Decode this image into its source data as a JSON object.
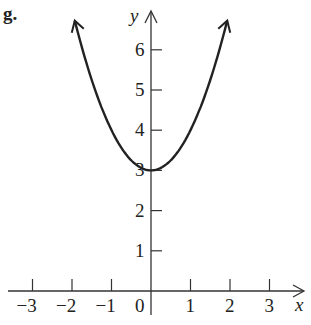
{
  "panel_label": "g.",
  "chart_data": {
    "type": "line",
    "title": "g.",
    "xlabel": "x",
    "ylabel": "y",
    "function": "y = x^2 + 3",
    "xlim": [
      -3.2,
      3.6
    ],
    "ylim": [
      -0.6,
      6.9
    ],
    "x_ticks": [
      -3,
      -2,
      -1,
      0,
      1,
      2,
      3
    ],
    "x_tick_labels": [
      "−3",
      "−2",
      "−1",
      "0",
      "1",
      "2",
      "3"
    ],
    "y_ticks": [
      1,
      2,
      3,
      4,
      5,
      6
    ],
    "y_tick_labels": [
      "1",
      "2",
      "3",
      "4",
      "5",
      "6"
    ],
    "series": [
      {
        "name": "curve",
        "x": [
          -1.95,
          -1.5,
          -1,
          -0.5,
          0,
          0.5,
          1,
          1.5,
          1.95
        ],
        "y": [
          6.8,
          5.25,
          4,
          3.25,
          3,
          3.25,
          4,
          5.25,
          6.8
        ]
      }
    ],
    "grid": false,
    "arrows": "both ends of curve and positive axes"
  }
}
